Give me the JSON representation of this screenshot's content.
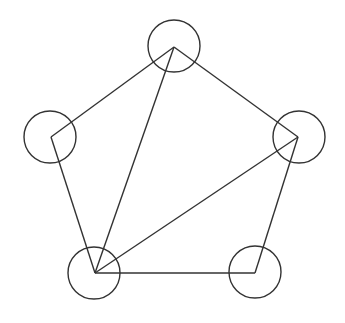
{
  "diagram": {
    "type": "pentagon-triangulation",
    "stroke_color": "#333333",
    "background": "#ffffff",
    "circle_radius": 26,
    "vertices": [
      {
        "id": "top",
        "x": 174,
        "y": 47
      },
      {
        "id": "right",
        "x": 298,
        "y": 137
      },
      {
        "id": "bottom-right",
        "x": 255,
        "y": 273
      },
      {
        "id": "bottom-left",
        "x": 95,
        "y": 273
      },
      {
        "id": "left",
        "x": 51,
        "y": 137
      }
    ],
    "circles": [
      {
        "id": "top",
        "cx": 174,
        "cy": 46
      },
      {
        "id": "right",
        "cx": 299,
        "cy": 137
      },
      {
        "id": "bottom-right",
        "cx": 255,
        "cy": 272
      },
      {
        "id": "bottom-left",
        "cx": 94,
        "cy": 273
      },
      {
        "id": "left",
        "cx": 50,
        "cy": 137
      }
    ],
    "edges": [
      [
        "top",
        "right"
      ],
      [
        "right",
        "bottom-right"
      ],
      [
        "bottom-right",
        "bottom-left"
      ],
      [
        "bottom-left",
        "left"
      ],
      [
        "left",
        "top"
      ],
      [
        "bottom-left",
        "top"
      ],
      [
        "bottom-left",
        "right"
      ]
    ]
  }
}
